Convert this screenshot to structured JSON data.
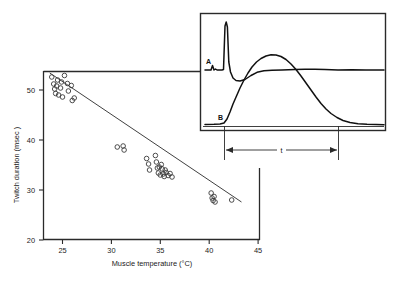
{
  "figure": {
    "name": "twitch-duration-vs-muscle-temperature"
  },
  "chart_data": {
    "type": "scatter",
    "title": "",
    "xlabel": "Muscle temperature (°C)",
    "ylabel": "Twitch duration (msec )",
    "xlim": [
      23,
      45.5
    ],
    "ylim": [
      20,
      55
    ],
    "xticks": [
      25,
      30,
      35,
      40,
      45
    ],
    "xtick_labels": [
      "25",
      "30",
      "35",
      "40",
      "45"
    ],
    "yticks": [
      20,
      30,
      40,
      50
    ],
    "ytick_labels": [
      "20",
      "30",
      "40",
      "50"
    ],
    "grid": false,
    "legend": "none",
    "marker": "open-circle",
    "points": [
      [
        23.9,
        52.6
      ],
      [
        24.1,
        51.2
      ],
      [
        24.2,
        50.2
      ],
      [
        24.3,
        49.3
      ],
      [
        24.4,
        50.8
      ],
      [
        24.5,
        52.0
      ],
      [
        24.6,
        49.0
      ],
      [
        24.8,
        50.4
      ],
      [
        24.9,
        51.6
      ],
      [
        25.0,
        48.6
      ],
      [
        25.2,
        52.9
      ],
      [
        25.5,
        51.3
      ],
      [
        25.6,
        49.8
      ],
      [
        25.9,
        50.9
      ],
      [
        26.0,
        47.9
      ],
      [
        26.2,
        48.4
      ],
      [
        30.6,
        38.6
      ],
      [
        31.2,
        38.8
      ],
      [
        31.3,
        38.0
      ],
      [
        33.6,
        36.3
      ],
      [
        33.8,
        35.2
      ],
      [
        33.9,
        34.0
      ],
      [
        34.5,
        36.9
      ],
      [
        34.6,
        35.6
      ],
      [
        34.7,
        34.4
      ],
      [
        34.8,
        33.4
      ],
      [
        34.9,
        34.6
      ],
      [
        35.0,
        33.0
      ],
      [
        35.1,
        35.1
      ],
      [
        35.2,
        34.2
      ],
      [
        35.3,
        33.2
      ],
      [
        35.4,
        32.7
      ],
      [
        35.5,
        34.0
      ],
      [
        35.6,
        33.5
      ],
      [
        35.8,
        32.9
      ],
      [
        36.0,
        33.3
      ],
      [
        36.2,
        32.6
      ],
      [
        40.2,
        29.4
      ],
      [
        40.3,
        28.4
      ],
      [
        40.4,
        27.9
      ],
      [
        40.5,
        28.7
      ],
      [
        40.6,
        27.6
      ],
      [
        42.3,
        28.0
      ]
    ],
    "fit_line": {
      "label": "regression line",
      "x": [
        23.7,
        43.3
      ],
      "y": [
        53.4,
        27.6
      ]
    }
  },
  "inset": {
    "name": "recording-traces-inset",
    "traces": [
      {
        "label": "A",
        "description": "electromyogram spike"
      },
      {
        "label": "B",
        "description": "mechanical twitch"
      }
    ],
    "duration_marker": {
      "label": "t",
      "description": "twitch duration interval"
    }
  }
}
